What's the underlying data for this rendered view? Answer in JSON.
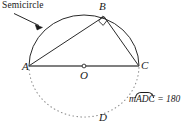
{
  "figure": {
    "type": "geometry-diagram",
    "labels": {
      "semicircle_callout": "Semicircle",
      "point_a": "A",
      "point_b": "B",
      "point_c": "C",
      "center_o": "O",
      "point_d": "D"
    },
    "arc_measure": {
      "prefix": "m",
      "arc_name": "ADC",
      "equals": "=",
      "value": "180"
    },
    "colors": {
      "stroke": "#1a1a1a",
      "diameter": "#4d4d4d",
      "dotted_arc": "#8c8c8c",
      "background": "#ffffff"
    },
    "geometry": {
      "center": {
        "x": 84,
        "y": 66
      },
      "radius_x": 55,
      "radius_y": 51,
      "point_a": {
        "x": 29,
        "y": 66
      },
      "point_b": {
        "x": 104,
        "y": 16
      },
      "point_c": {
        "x": 139,
        "y": 66
      },
      "point_d": {
        "x": 95,
        "y": 117
      },
      "right_angle_at": "B",
      "upper_arc_style": "solid",
      "lower_arc_style": "dotted"
    }
  }
}
